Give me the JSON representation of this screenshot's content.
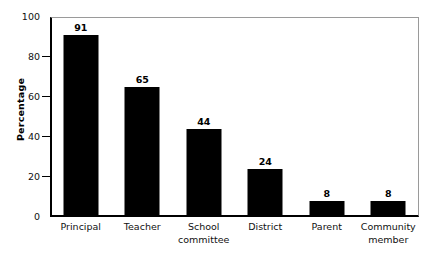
{
  "chart_data": {
    "type": "bar",
    "title": "",
    "xlabel": "",
    "ylabel": "Percentage",
    "ylim": [
      0,
      100
    ],
    "yticks": [
      0,
      20,
      40,
      60,
      80,
      100
    ],
    "grid": false,
    "legend": null,
    "categories": [
      "Principal",
      "Teacher",
      "School committee",
      "District",
      "Parent",
      "Community member"
    ],
    "category_lines": [
      [
        "Principal"
      ],
      [
        "Teacher"
      ],
      [
        "School",
        "committee"
      ],
      [
        "District"
      ],
      [
        "Parent"
      ],
      [
        "Community",
        "member"
      ]
    ],
    "values": [
      91,
      65,
      44,
      24,
      8,
      8
    ],
    "value_labels": [
      "91",
      "65",
      "44",
      "24",
      "8",
      "8"
    ],
    "bar_color": "#000000",
    "axis_color": "#000000",
    "frame_color": "#9a9a9a",
    "background": "#ffffff"
  }
}
